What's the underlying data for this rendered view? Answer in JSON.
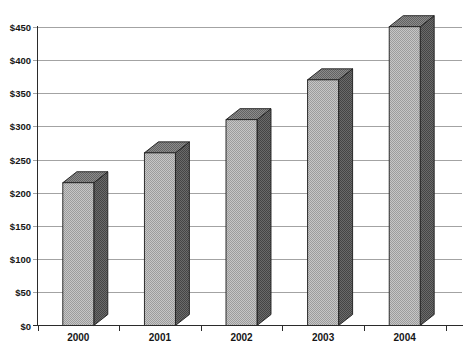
{
  "page": {
    "background": "#ffffff",
    "title": ""
  },
  "chart_data": {
    "type": "bar",
    "style": "3d-column-grayscale-halftone",
    "title": "",
    "xlabel": "",
    "ylabel": "",
    "categories": [
      "2000",
      "2001",
      "2002",
      "2003",
      "2004"
    ],
    "values": [
      215,
      260,
      310,
      370,
      450
    ],
    "ylim": [
      0,
      450
    ],
    "ytick_step": 50,
    "ytick_labels": [
      "$0",
      "$50",
      "$100",
      "$150",
      "$200",
      "$250",
      "$300",
      "$350",
      "$400",
      "$450"
    ],
    "value_format": "currency_usd",
    "grid": true,
    "legend": false,
    "colors": {
      "background": "#ffffff",
      "gridline": "#a3a3a3",
      "axis": "#2b2b2b",
      "label": "#161616",
      "bar_front_light": "#c6c6c6",
      "bar_front_dark": "#9c9c9c",
      "bar_side_light": "#6a6a6a",
      "bar_side_dark": "#454545",
      "bar_top_light": "#8c8c8c",
      "bar_top_dark": "#626262",
      "bar_outline": "#1c1c1c"
    }
  }
}
